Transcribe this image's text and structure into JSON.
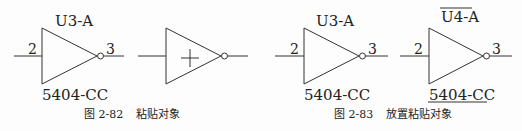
{
  "figures": [
    {
      "caption_number": "图 2-82",
      "caption_text": "粘贴对象",
      "gates": [
        {
          "ref": "U3-A",
          "part": "5404-CC",
          "pin_in": "2",
          "pin_out": "3",
          "state": "normal"
        },
        {
          "ref": "",
          "part": "",
          "pin_in": "",
          "pin_out": "",
          "state": "dragging"
        }
      ]
    },
    {
      "caption_number": "图 2-83",
      "caption_text": "放置粘贴对象",
      "gates": [
        {
          "ref": "U3-A",
          "part": "5404-CC",
          "pin_in": "2",
          "pin_out": "3",
          "state": "normal"
        },
        {
          "ref": "U4-A",
          "part": "5404-CC",
          "pin_in": "2",
          "pin_out": "3",
          "state": "placed"
        }
      ]
    }
  ],
  "colors": {
    "line": "#333333",
    "text": "#222222",
    "background": "#fdfdfd"
  }
}
